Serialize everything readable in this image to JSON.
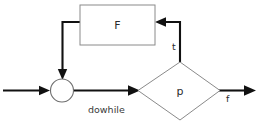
{
  "diagram": {
    "caption": "dowhile",
    "nodes": {
      "process": {
        "label": "F",
        "shape": "rectangle"
      },
      "junction": {
        "label": "",
        "shape": "circle"
      },
      "decision": {
        "label": "p",
        "shape": "diamond"
      }
    },
    "edge_labels": {
      "true_branch": "t",
      "false_branch": "f"
    }
  },
  "colors": {
    "background": "#ffffff",
    "line": "#111111",
    "shape_stroke": "#6e6e6e",
    "text": "#2b2b2b"
  }
}
